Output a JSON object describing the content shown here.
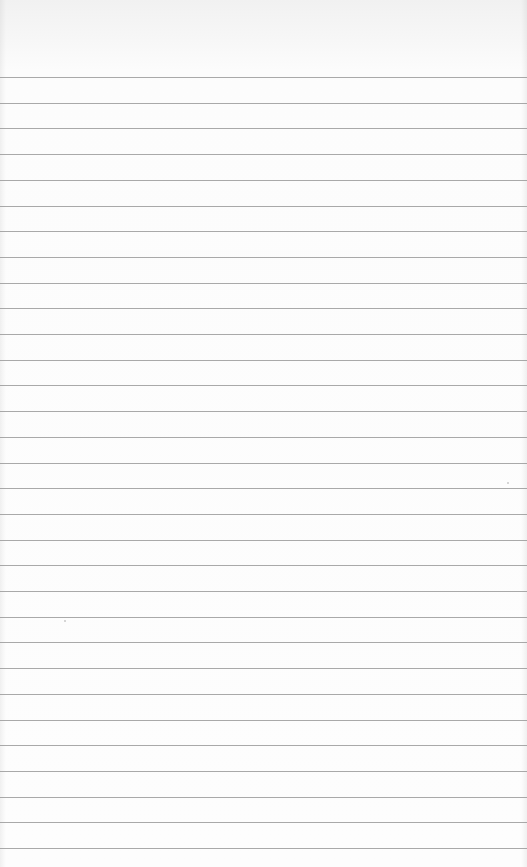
{
  "page": {
    "type": "blank lined paper",
    "background_color": "#fbfbfb",
    "line_color": "#9a9a9a",
    "line_count": 31,
    "first_line_y": 77,
    "line_spacing": 25.7
  }
}
